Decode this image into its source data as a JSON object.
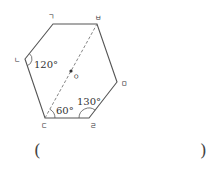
{
  "figure": {
    "shape": "hexagon",
    "vertices": [
      {
        "id": "g",
        "label": "ㄱ",
        "x": 53,
        "y": 24,
        "label_x": 51,
        "label_y": 19
      },
      {
        "id": "n",
        "label": "ㄴ",
        "x": 25,
        "y": 59,
        "label_x": 17,
        "label_y": 62
      },
      {
        "id": "d",
        "label": "ㄷ",
        "x": 45,
        "y": 118,
        "label_x": 44,
        "label_y": 128
      },
      {
        "id": "r",
        "label": "ㄹ",
        "x": 89,
        "y": 118,
        "label_x": 93,
        "label_y": 128
      },
      {
        "id": "m",
        "label": "ㅁ",
        "x": 117,
        "y": 82,
        "label_x": 124,
        "label_y": 86
      },
      {
        "id": "b",
        "label": "ㅂ",
        "x": 97,
        "y": 24,
        "label_x": 98,
        "label_y": 20
      }
    ],
    "diagonal": {
      "from": "ㄷ",
      "to": "ㅂ",
      "style": "dashed"
    },
    "center_point": {
      "label": "ㅇ",
      "x": 71,
      "y": 71,
      "label_x": 76,
      "label_y": 79
    },
    "angles": [
      {
        "at": "ㄴ",
        "value": "120°",
        "label_x": 34,
        "label_y": 68
      },
      {
        "at": "ㄷ",
        "value": "60°",
        "label_x": 56,
        "label_y": 114
      },
      {
        "at": "ㄹ",
        "value": "130°",
        "label_x": 77,
        "label_y": 105
      }
    ],
    "line_color": "#555555",
    "text_color": "#333333"
  },
  "answer": {
    "open_paren": "(",
    "close_paren": ")",
    "value": ""
  }
}
